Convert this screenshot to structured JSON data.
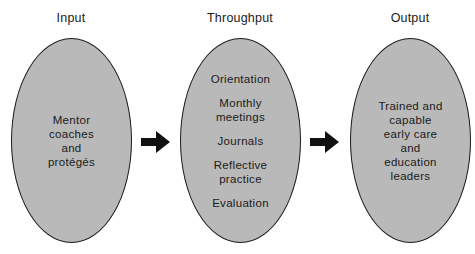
{
  "diagram": {
    "type": "process-flow",
    "stages": [
      {
        "title": "Input",
        "lines": [
          "Mentor",
          "coaches",
          "and",
          "protégés"
        ]
      },
      {
        "title": "Throughput",
        "items": [
          "Orientation",
          "Monthly\nmeetings",
          "Journals",
          "Reflective\npractice",
          "Evaluation"
        ]
      },
      {
        "title": "Output",
        "lines": [
          "Trained and",
          "capable",
          "early care",
          "and",
          "education",
          "leaders"
        ]
      }
    ],
    "connectors": [
      {
        "from": "Input",
        "to": "Throughput",
        "icon": "right-arrow-icon"
      },
      {
        "from": "Throughput",
        "to": "Output",
        "icon": "right-arrow-icon"
      }
    ],
    "colors": {
      "ellipse_fill": "#b9b9b9",
      "stroke": "#1a1a1a",
      "arrow": "#111111"
    }
  },
  "labels": {
    "input_title": "Input",
    "throughput_title": "Throughput",
    "output_title": "Output",
    "input_text": [
      "Mentor",
      "coaches",
      "and",
      "protégés"
    ],
    "throughput_items": [
      "Orientation",
      "Monthly",
      "meetings",
      "Journals",
      "Reflective",
      "practice",
      "Evaluation"
    ],
    "output_text": [
      "Trained and",
      "capable",
      "early care",
      "and",
      "education",
      "leaders"
    ]
  }
}
